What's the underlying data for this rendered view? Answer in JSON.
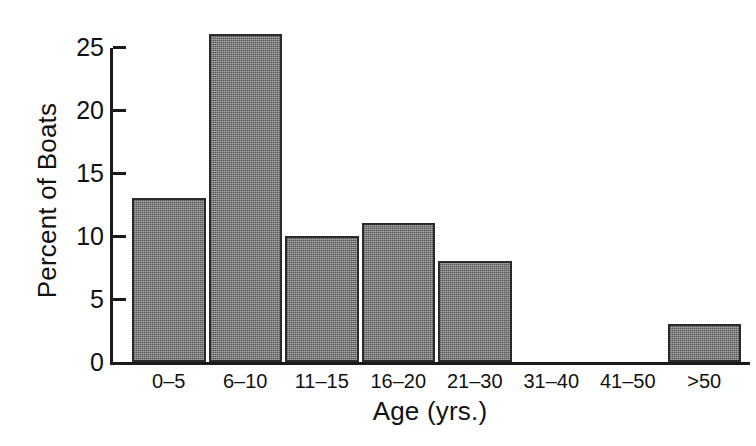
{
  "chart_data": {
    "type": "bar",
    "title": "",
    "xlabel": "Age (yrs.)",
    "ylabel": "Percent of Boats",
    "categories": [
      "0–5",
      "6–10",
      "11–15",
      "16–20",
      "21–30",
      "31–40",
      "41–50",
      ">50"
    ],
    "values": [
      13,
      26,
      10,
      11,
      8,
      0,
      0,
      3
    ],
    "ylim": [
      0,
      26
    ],
    "yticks": [
      0,
      5,
      10,
      15,
      20,
      25
    ],
    "ytick_labels": [
      "0",
      "5",
      "10",
      "15",
      "20",
      "25"
    ],
    "grid": false,
    "legend": false,
    "bar_fill_color": "#7a7a7a",
    "bar_border_color": "#2b2b2b",
    "axis_color": "#1a1a1a",
    "background_color": "#ffffff"
  }
}
